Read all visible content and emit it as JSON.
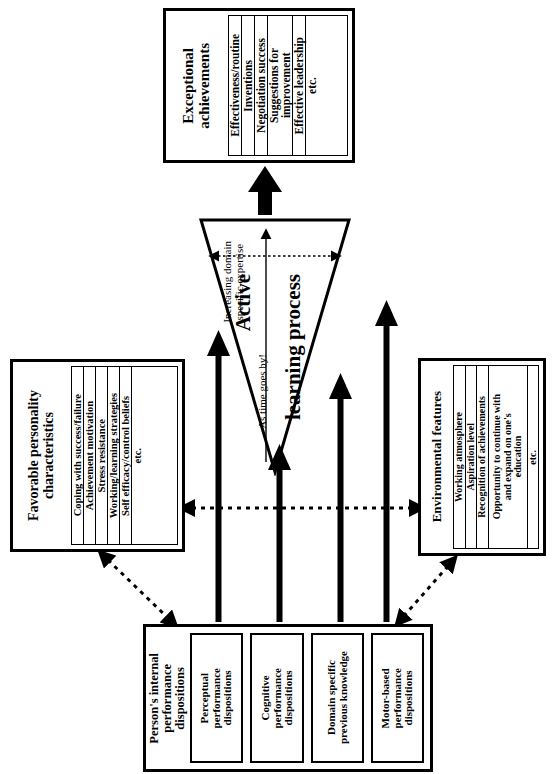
{
  "diagram": {
    "orientation": "rotated-90",
    "top_box": {
      "title": "Exceptional\nachievements",
      "items": [
        "Effectiveness/routine",
        "Inventions",
        "Negotiation success",
        "Suggestions for\nimprovement",
        "Effective leadership",
        "etc."
      ]
    },
    "left_box": {
      "title": "Favorable personality\ncharacteristics",
      "items": [
        "Coping with success/failure",
        "Achievement motivation",
        "Stress resistance",
        "Working/learning strategies",
        "Self efficacy/control beliefs",
        "etc."
      ]
    },
    "right_box": {
      "title": "Environmental features",
      "items": [
        "Working atmosphere",
        "Aspiration level",
        "Recognition of achievements",
        "Opportunity to continue with\nand expand on one's\neducation",
        "etc."
      ]
    },
    "bottom_box": {
      "title": "Person's internal\nperformance\ndispositions",
      "items": [
        "Perceptual\nperformance\ndispositions",
        "Cognitive\nperformance\ndispositions",
        "Domain specific\nprevious knowledge",
        "Motor-based\nperformance\ndispositions"
      ]
    },
    "triangle": {
      "label_line1": "Active",
      "label_line2": "learning process",
      "time_label": "As time goes by!",
      "expertise_label": "Increasing domain\nspecific expertise"
    },
    "colors": {
      "stroke": "#000000",
      "background": "#ffffff"
    }
  }
}
